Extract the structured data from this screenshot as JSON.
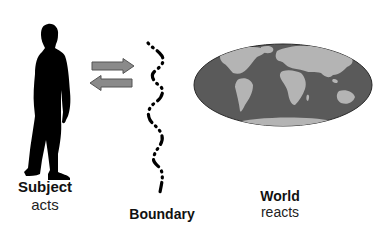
{
  "diagram": {
    "subject": {
      "title": "Subject",
      "subtitle": "acts",
      "icon": "person-silhouette-icon"
    },
    "boundary": {
      "title": "Boundary",
      "icon": "dashed-wavy-line"
    },
    "world": {
      "title": "World",
      "subtitle": "reacts",
      "icon": "world-map-globe-icon"
    },
    "arrows": [
      {
        "direction": "right",
        "from": "Subject",
        "to": "World"
      },
      {
        "direction": "left",
        "from": "World",
        "to": "Subject"
      }
    ]
  },
  "colors": {
    "silhouette": "#000000",
    "arrow_fill": "#8a8a8a",
    "arrow_stroke": "#555555",
    "ocean": "#5a5a5a",
    "land": "#b4b4b4",
    "text": "#111111"
  }
}
